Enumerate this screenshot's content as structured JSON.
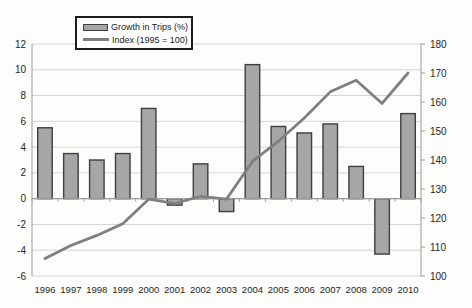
{
  "chart_data": {
    "type": "combo",
    "title": "",
    "categories": [
      "1996",
      "1997",
      "1998",
      "1999",
      "2000",
      "2001",
      "2002",
      "2003",
      "2004",
      "2005",
      "2006",
      "2007",
      "2008",
      "2009",
      "2010"
    ],
    "series": [
      {
        "name": "Growth in Trips (%)",
        "type": "bar",
        "axis": "left",
        "values": [
          5.5,
          3.5,
          3.0,
          3.5,
          7.0,
          -0.5,
          2.7,
          -1.0,
          10.4,
          5.6,
          5.1,
          5.8,
          2.5,
          -4.3,
          6.6
        ]
      },
      {
        "name": "Index (1995 = 100)",
        "type": "line",
        "axis": "right",
        "values": [
          106,
          110.5,
          114,
          118,
          126.5,
          125,
          127.5,
          126.5,
          139.5,
          146.5,
          154.5,
          163.5,
          167.5,
          159.5,
          170
        ]
      }
    ],
    "left_axis": {
      "min": -6,
      "max": 12,
      "ticks": [
        12,
        10,
        8,
        6,
        4,
        2,
        0,
        -2,
        -4,
        -6
      ]
    },
    "right_axis": {
      "min": 100,
      "max": 180,
      "ticks": [
        180,
        170,
        160,
        150,
        140,
        130,
        120,
        110,
        100
      ]
    },
    "grid": true,
    "legend_position": "top-inside",
    "colors": {
      "bar_fill": "#a6a6a6",
      "bar_border": "#3f3f3f",
      "line": "#7f7f7f",
      "grid": "#d4d4d2",
      "axis_line": "#9b9b99",
      "zero_line": "#9b9b99",
      "tick_text": "#262626",
      "legend_border": "#1c1c1c",
      "background": "#fdfdfc"
    }
  },
  "legend": {
    "bar_label": "Growth in Trips (%)",
    "line_label": "Index (1995 = 100)"
  }
}
